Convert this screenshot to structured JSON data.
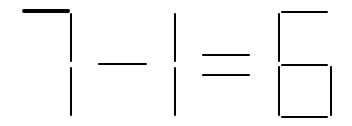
{
  "puzzle": {
    "type": "matchstick-equation",
    "equation": "7-1=6",
    "symbols": [
      "7",
      "-",
      "1",
      "=",
      "6"
    ],
    "highlighted_match": "top segment of 7"
  },
  "colors": {
    "stroke": "#000000",
    "background": "#ffffff"
  }
}
